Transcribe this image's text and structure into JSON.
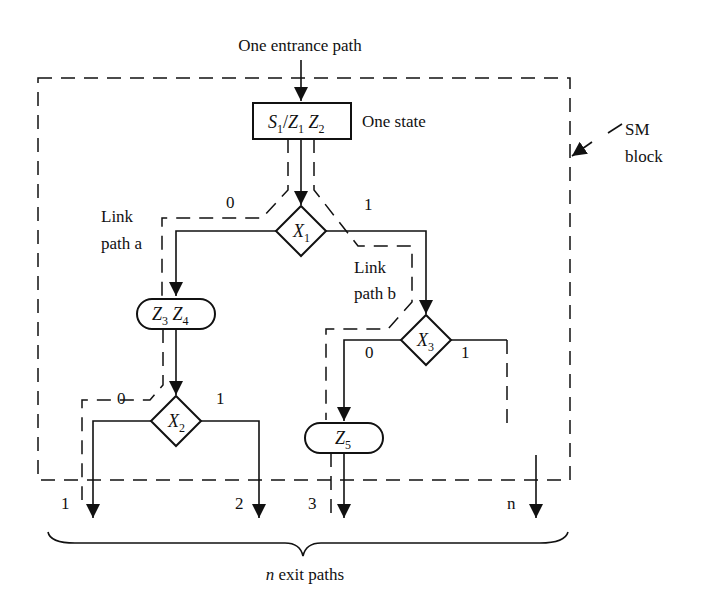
{
  "diagram": {
    "entrance_label": "One entrance path",
    "state_box": {
      "state": "S",
      "state_sub": "1",
      "outputs": [
        {
          "name": "Z",
          "sub": "1"
        },
        {
          "name": "Z",
          "sub": "2"
        }
      ],
      "annotation": "One state"
    },
    "sm_block_label": {
      "line1": "SM",
      "line2": "block"
    },
    "decisions": [
      {
        "id": "x1",
        "var": "X",
        "sub": "1",
        "branch0": "0",
        "branch1": "1"
      },
      {
        "id": "x2",
        "var": "X",
        "sub": "2",
        "branch0": "0",
        "branch1": "1"
      },
      {
        "id": "x3",
        "var": "X",
        "sub": "3",
        "branch0": "0",
        "branch1": "1"
      }
    ],
    "conditional_outputs": [
      {
        "id": "z3z4",
        "items": [
          {
            "name": "Z",
            "sub": "3"
          },
          {
            "name": "Z",
            "sub": "4"
          }
        ]
      },
      {
        "id": "z5",
        "items": [
          {
            "name": "Z",
            "sub": "5"
          }
        ]
      }
    ],
    "link_paths": [
      {
        "line1": "Link",
        "line2": "path a"
      },
      {
        "line1": "Link",
        "line2": "path b"
      }
    ],
    "exit_labels": [
      "1",
      "2",
      "3",
      "n"
    ],
    "exit_caption": {
      "n": "n",
      "rest": " exit paths"
    }
  }
}
